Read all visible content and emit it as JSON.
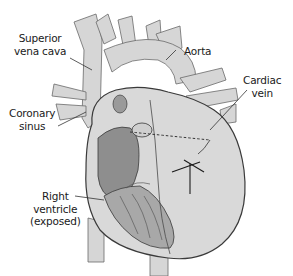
{
  "diagram": {
    "colors": {
      "vessel_fill": "#d6d6d6",
      "heart_fill": "#d9d9d9",
      "ventricle_fill": "#8e8e8e",
      "muscle_fill": "#a8a8a8",
      "outline": "#3a3a3a",
      "leader_line": "#333333"
    },
    "labels": {
      "superior_vena_cava": {
        "line1": "Superior",
        "line2": "vena cava"
      },
      "aorta": {
        "line1": "Aorta"
      },
      "cardiac_vein": {
        "line1": "Cardiac",
        "line2": "vein"
      },
      "coronary_sinus": {
        "line1": "Coronary",
        "line2": "sinus"
      },
      "right_ventricle": {
        "line1": "Right",
        "line2": "ventricle",
        "line3": "(exposed)"
      }
    }
  }
}
